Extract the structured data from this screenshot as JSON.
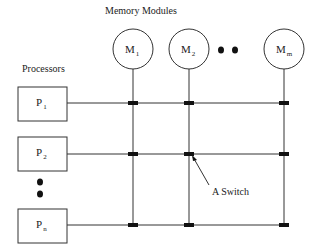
{
  "diagram": {
    "title": "Memory Modules",
    "processors_label": "Processors",
    "switch_label": "A Switch",
    "memory_modules": [
      {
        "base": "M",
        "sub": "1"
      },
      {
        "base": "M",
        "sub": "2"
      },
      {
        "base": "M",
        "sub": "m"
      }
    ],
    "processors": [
      {
        "base": "P",
        "sub": "1"
      },
      {
        "base": "P",
        "sub": "2"
      },
      {
        "base": "P",
        "sub": "n"
      }
    ],
    "colors": {
      "line": "#333333",
      "switch": "#111111",
      "background": "#ffffff"
    }
  }
}
